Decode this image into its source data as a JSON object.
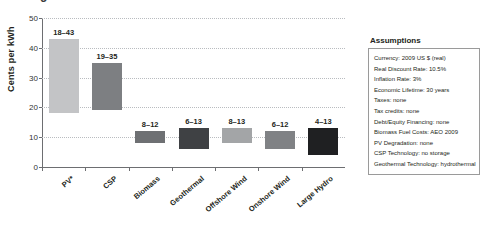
{
  "figure": {
    "clipped_title_remnant": "g",
    "ylabel": "Cents per kWh"
  },
  "assumptions": {
    "heading": "Assumptions",
    "items": [
      "Currency: 2009 US $ (real)",
      "Real Discount Rate: 10.5%",
      "Inflation Rate: 3%",
      "Economic Lifetime: 30 years",
      "Taxes: none",
      "Tax credits: none",
      "Debt/Equity Financing: none",
      "Biomass Fuel Costs: AEO 2009",
      "PV Degradation: none",
      "CSP Technology: no storage",
      "Geothermal Technology: hydrothermal"
    ]
  },
  "chart_data": {
    "type": "bar",
    "subtype": "floating-range-bar",
    "title": "",
    "xlabel": "",
    "ylabel": "Cents per kWh",
    "ylim": [
      0,
      50
    ],
    "yticks": [
      0,
      10,
      20,
      30,
      40,
      50
    ],
    "grid": true,
    "grid_axis": "y",
    "legend": "none",
    "categories": [
      "PV*",
      "CSP",
      "Biomass",
      "Geothermal",
      "Offshore Wind",
      "Onshore Wind",
      "Large Hydro"
    ],
    "series": [
      {
        "name": "Levelized cost range",
        "low": [
          18,
          19,
          8,
          6,
          8,
          6,
          4
        ],
        "high": [
          43,
          35,
          12,
          13,
          13,
          12,
          13
        ],
        "labels": [
          "18–43",
          "19–35",
          "8–12",
          "6–13",
          "8–13",
          "6–12",
          "4–13"
        ],
        "colors": [
          "#c3c4c6",
          "#7d7f82",
          "#6e7073",
          "#3f4144",
          "#a3a5a7",
          "#808285",
          "#1f2022"
        ]
      }
    ]
  }
}
